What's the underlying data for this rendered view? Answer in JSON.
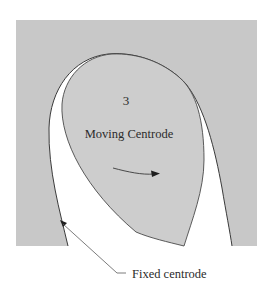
{
  "figure": {
    "body_number": "3",
    "moving_label": "Moving Centrode",
    "fixed_label": "Fixed centrode",
    "colors": {
      "background_panel": "#c8c8c8",
      "moving_body": "#cdcdcd",
      "gap": "#ffffff",
      "line": "#3a3a3a"
    }
  }
}
